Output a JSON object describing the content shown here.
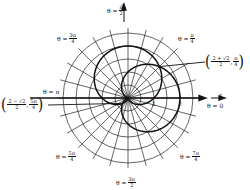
{
  "chart_data": {
    "type": "polar",
    "title": "",
    "curves": [
      {
        "name": "r = 1 + sin θ",
        "equation": "r = 1 + sin(theta)",
        "color": "#111111"
      },
      {
        "name": "r = 1 + cos θ",
        "equation": "r = 1 + cos(theta)",
        "color": "#111111"
      }
    ],
    "grid": {
      "ring_step": 0.5,
      "ring_max": 2.5,
      "radial_step_deg": 15
    },
    "axes": {
      "x_label": "x",
      "y_label": "y",
      "tick_labels": [
        "1",
        "2"
      ]
    },
    "angle_labels": [
      {
        "id": "pi_over_2",
        "prefix": "θ =",
        "num": "π",
        "den": "2"
      },
      {
        "id": "three_pi_over_4",
        "prefix": "θ =",
        "num": "3π",
        "den": "4"
      },
      {
        "id": "pi_over_4",
        "prefix": "θ =",
        "num": "π",
        "den": "4"
      },
      {
        "id": "pi",
        "prefix": "θ = π",
        "num": "",
        "den": ""
      },
      {
        "id": "zero",
        "prefix": "θ = 0",
        "num": "",
        "den": ""
      },
      {
        "id": "five_pi_over_4",
        "prefix": "θ =",
        "num": "5π",
        "den": "4"
      },
      {
        "id": "seven_pi_over_4",
        "prefix": "θ =",
        "num": "7π",
        "den": "4"
      },
      {
        "id": "three_pi_over_2",
        "prefix": "θ =",
        "num": "3π",
        "den": "2"
      }
    ],
    "intersection_points": [
      {
        "r_num": "2 + √2",
        "r_den": "2",
        "theta_num": "π",
        "theta_den": "4",
        "r_value": 1.707,
        "theta": "π/4"
      },
      {
        "r_num": "2 − √2",
        "r_den": "2",
        "theta_num": "5π",
        "theta_den": "4",
        "r_value": 0.293,
        "theta": "5π/4"
      },
      {
        "r_value": 0,
        "theta": "pole"
      }
    ]
  },
  "labels": {
    "a0": {
      "prefix": "θ =",
      "num": "π",
      "den": "2"
    },
    "a1": {
      "prefix": "θ =",
      "num": "3π",
      "den": "4"
    },
    "a2": {
      "prefix": "θ =",
      "num": "π",
      "den": "4"
    },
    "a3": {
      "prefix": "θ = π"
    },
    "a4": {
      "prefix": "θ = 0"
    },
    "a5": {
      "prefix": "θ =",
      "num": "5π",
      "den": "4"
    },
    "a6": {
      "prefix": "θ =",
      "num": "7π",
      "den": "4"
    },
    "a7": {
      "prefix": "θ =",
      "num": "3π",
      "den": "2"
    },
    "p1": {
      "r_num": "2 + √2",
      "r_den": "2",
      "t_num": "π",
      "t_den": "4"
    },
    "p2": {
      "r_num": "2 − √2",
      "r_den": "2",
      "t_num": "5π",
      "t_den": "4"
    },
    "tick1": "1",
    "tick2": "2",
    "xlabel": "x",
    "ylabel": "y",
    "comma": ","
  }
}
